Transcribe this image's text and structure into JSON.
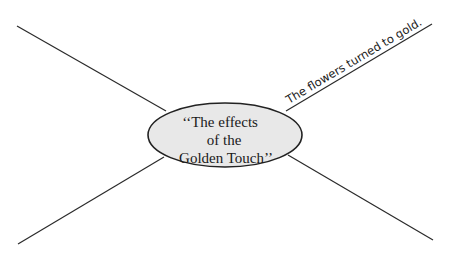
{
  "diagram": {
    "type": "spider-map",
    "center": {
      "lines": [
        "‘‘The effects",
        "of the",
        "Golden Touch’’"
      ],
      "fill": "#e8e8e8",
      "stroke": "#222222"
    },
    "branches": [
      {
        "position": "top-left",
        "label": ""
      },
      {
        "position": "top-right",
        "label": "The flowers turned to gold."
      },
      {
        "position": "bottom-left",
        "label": ""
      },
      {
        "position": "bottom-right",
        "label": ""
      }
    ],
    "line_color": "#2a2a2a"
  }
}
